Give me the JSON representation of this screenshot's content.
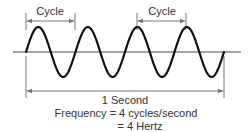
{
  "diagram": {
    "type": "sine-wave-frequency",
    "cycles_count": 4,
    "wave": {
      "start_x": 26,
      "end_x": 224,
      "axis_y": 52,
      "amplitude": 25,
      "cycles": 4,
      "stroke_color": "#111111",
      "stroke_width": 2.2
    },
    "axis": {
      "x1": 13,
      "x2": 241,
      "y": 52,
      "color": "#888888"
    },
    "cycle_markers": [
      {
        "label": "Cycle",
        "x1": 26,
        "x2": 75,
        "arrow_y": 21,
        "tick_top": 13,
        "tick_bottom": 30,
        "label_x": 50,
        "label_y": 6
      },
      {
        "label": "Cycle",
        "x1": 137,
        "x2": 186,
        "arrow_y": 21,
        "tick_top": 13,
        "tick_bottom": 30,
        "label_x": 162,
        "label_y": 6
      }
    ],
    "duration_marker": {
      "label": "1 Second",
      "x1": 26,
      "x2": 224,
      "arrow_y": 91,
      "tick_top": 56,
      "tick_bottom": 98,
      "label_x": 125,
      "label_y": 95
    },
    "formula": {
      "line1": "Frequency = 4 cycles/second",
      "line2": "= 4 Hertz",
      "line1_x": 126,
      "line1_y": 108,
      "line2_x": 140,
      "line2_y": 121
    },
    "colors": {
      "wave": "#111111",
      "axis": "#888888",
      "markers": "#777777",
      "text": "#333333"
    }
  }
}
